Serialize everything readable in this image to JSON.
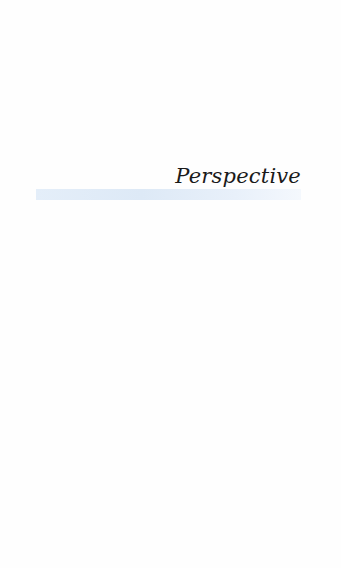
{
  "page": {
    "title": "Perspective",
    "accent_bar_color": "#dde9f6"
  }
}
